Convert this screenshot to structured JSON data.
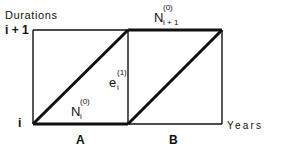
{
  "diagram": {
    "y_axis": {
      "title": "Durations",
      "ticks": [
        {
          "label": "i + 1"
        },
        {
          "label": "i"
        }
      ]
    },
    "x_axis": {
      "title": "Years"
    },
    "regions": [
      {
        "label": "A"
      },
      {
        "label": "B"
      }
    ],
    "labels": {
      "top_segment": {
        "base": "N",
        "sup": "(0)",
        "sub": "i + 1"
      },
      "middle_line": {
        "base": "e",
        "sup": "(1)",
        "sub": "i"
      },
      "bottom_segment": {
        "base": "N",
        "sup": "(0)",
        "sub": "i"
      }
    },
    "colors": {
      "line": "#111111",
      "background": "#ffffff"
    }
  }
}
